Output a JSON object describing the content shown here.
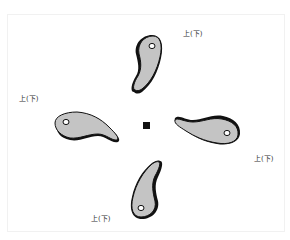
{
  "diagram": {
    "labels": [
      {
        "id": "top",
        "text": "上(下)"
      },
      {
        "id": "left",
        "text": "上(下)"
      },
      {
        "id": "right",
        "text": "上(下)"
      },
      {
        "id": "bottom",
        "text": "上(下)"
      }
    ],
    "center_marker": "square",
    "piece_count": 4,
    "colors": {
      "piece_fill": "#c4c4c4",
      "piece_outline": "#111111",
      "hole_fill": "#ffffff",
      "center_marker": "#111111"
    }
  }
}
